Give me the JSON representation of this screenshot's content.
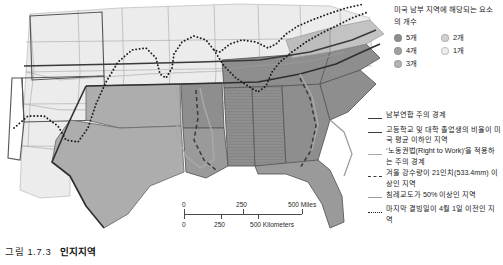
{
  "figure": {
    "caption_number": "그림 1.7.3",
    "caption_title": "인지지역"
  },
  "map": {
    "name": "미국 남부 인지지역 지도",
    "ocean_color": "#ffffff",
    "land_base_color": "#e9e9e9"
  },
  "scalebar": {
    "miles": {
      "ticks": [
        "0",
        "250",
        "500 Miles"
      ]
    },
    "kilometers": {
      "ticks": [
        "0",
        "250",
        "500 Kilometers"
      ]
    }
  },
  "legend_counts": {
    "title": "미국 남부 지역에 해당되는 요소의 개수",
    "left_column": [
      {
        "label": "5개",
        "color": "#8e8e8e"
      },
      {
        "label": "4개",
        "color": "#a0a0a0"
      },
      {
        "label": "3개",
        "color": "#b4b4b4"
      }
    ],
    "right_column": [
      {
        "label": "2개",
        "color": "#d2d2d2"
      },
      {
        "label": "1개",
        "color": "#ececec"
      }
    ]
  },
  "legend_lines": [
    {
      "label": "남부연합 주의 경계",
      "style": "solid",
      "color": "#3a3a3a",
      "width": "1.6px"
    },
    {
      "label": "고등학교 및 대학 졸업생의 비율이 미국 평균 이하인 지역",
      "style": "solid",
      "color": "#3a3a3a",
      "width": "1.6px"
    },
    {
      "label": "‘노동권법(Right to Work)’을 적용하는 주의 경계",
      "style": "solid",
      "color": "#a8a8a8",
      "width": "1.6px"
    },
    {
      "label": "겨울 강수량이 21인치(533.4mm) 이상인 지역",
      "style": "dashed",
      "color": "#3a3a3a",
      "width": "1.6px"
    },
    {
      "label": "침례교도가 50% 이상인 지역",
      "style": "solid",
      "color": "#9a9a9a",
      "width": "1.4px"
    },
    {
      "label": "마지막 결빙일이 4월 1일 이전인 지역",
      "style": "dotted",
      "color": "#222222",
      "width": "1.8px"
    }
  ]
}
